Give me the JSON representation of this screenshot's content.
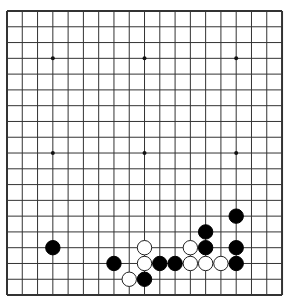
{
  "board": {
    "size": 19,
    "origin_x": 7,
    "origin_y": 11,
    "spacing_x": 15.28,
    "spacing_y": 15.78,
    "line_color": "#333333",
    "border_color": "#333333",
    "background": "#ffffff",
    "star_points": [
      [
        3,
        3
      ],
      [
        9,
        3
      ],
      [
        15,
        3
      ],
      [
        3,
        9
      ],
      [
        9,
        9
      ],
      [
        15,
        9
      ],
      [
        3,
        15
      ],
      [
        9,
        15
      ],
      [
        15,
        15
      ]
    ]
  },
  "stones": [
    {
      "color": "black",
      "col": 15,
      "row": 13
    },
    {
      "color": "black",
      "col": 13,
      "row": 14
    },
    {
      "color": "black",
      "col": 3,
      "row": 15
    },
    {
      "color": "white",
      "col": 9,
      "row": 15
    },
    {
      "color": "white",
      "col": 12,
      "row": 15
    },
    {
      "color": "black",
      "col": 13,
      "row": 15
    },
    {
      "color": "black",
      "col": 15,
      "row": 15
    },
    {
      "color": "black",
      "col": 7,
      "row": 16
    },
    {
      "color": "white",
      "col": 9,
      "row": 16
    },
    {
      "color": "black",
      "col": 10,
      "row": 16
    },
    {
      "color": "black",
      "col": 11,
      "row": 16
    },
    {
      "color": "white",
      "col": 12,
      "row": 16
    },
    {
      "color": "white",
      "col": 13,
      "row": 16
    },
    {
      "color": "white",
      "col": 14,
      "row": 16
    },
    {
      "color": "black",
      "col": 15,
      "row": 16
    },
    {
      "color": "white",
      "col": 8,
      "row": 17
    },
    {
      "color": "black",
      "col": 9,
      "row": 17
    }
  ]
}
